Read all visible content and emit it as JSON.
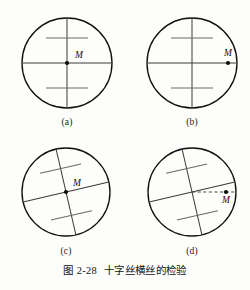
{
  "figure": {
    "caption_number": "图 2-28",
    "caption_text": "十字丝横丝的检验",
    "background_color": "#fdfdfb",
    "ink_color": "#111111",
    "hair_color": "#3a3a3a"
  },
  "panels": [
    {
      "id": "a",
      "label": "(a)",
      "label_x": 47,
      "label_y": 117,
      "circle": {
        "cx": 67,
        "cy": 63,
        "r": 45
      },
      "rotation_deg": 0,
      "point": {
        "name": "M",
        "x": 67,
        "y": 63,
        "label_dx": 8,
        "label_dy": -5,
        "at_center": true
      },
      "dashed_connector": false,
      "stadia_ticks": [
        {
          "offset": -25,
          "half_length": 21
        },
        {
          "offset": 25,
          "half_length": 21
        }
      ]
    },
    {
      "id": "b",
      "label": "(b)",
      "label_x": 172,
      "label_y": 117,
      "circle": {
        "cx": 192,
        "cy": 63,
        "r": 45
      },
      "rotation_deg": 0,
      "point": {
        "name": "M",
        "x": 228,
        "y": 63,
        "label_dx": 0,
        "label_dy": -7,
        "at_center": false
      },
      "dashed_connector": false,
      "stadia_ticks": [
        {
          "offset": -25,
          "half_length": 21
        },
        {
          "offset": 25,
          "half_length": 21
        }
      ]
    },
    {
      "id": "c",
      "label": "(c)",
      "label_x": 46,
      "label_y": 246,
      "circle": {
        "cx": 66,
        "cy": 192,
        "r": 44
      },
      "rotation_deg": -13,
      "point": {
        "name": "M",
        "x": 66,
        "y": 192,
        "label_dx": 7,
        "label_dy": -6,
        "at_center": true
      },
      "dashed_connector": false,
      "stadia_ticks": [
        {
          "offset": -24,
          "half_length": 21
        },
        {
          "offset": 24,
          "half_length": 21
        }
      ]
    },
    {
      "id": "d",
      "label": "(d)",
      "label_x": 172,
      "label_y": 246,
      "circle": {
        "cx": 192,
        "cy": 192,
        "r": 44
      },
      "rotation_deg": -13,
      "point": {
        "name": "M",
        "x": 226,
        "y": 192,
        "label_dx": 0,
        "label_dy": 11,
        "at_center": false
      },
      "dashed_connector": true,
      "dashed_from_x": 192,
      "stadia_ticks": [
        {
          "offset": -24,
          "half_length": 21
        },
        {
          "offset": 24,
          "half_length": 21
        }
      ]
    }
  ]
}
